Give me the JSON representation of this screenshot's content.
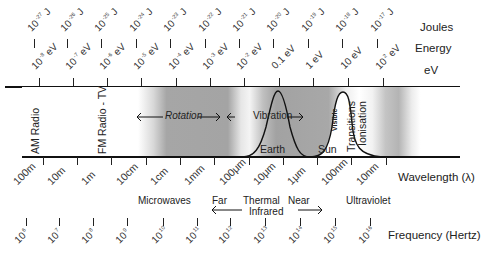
{
  "axes": {
    "joules": {
      "label": "Joules",
      "ticks": [
        {
          "base": "10",
          "exp": "-27",
          "unit": "J"
        },
        {
          "base": "10",
          "exp": "-26",
          "unit": "J"
        },
        {
          "base": "10",
          "exp": "-25",
          "unit": "J"
        },
        {
          "base": "10",
          "exp": "-24",
          "unit": "J"
        },
        {
          "base": "10",
          "exp": "-23",
          "unit": "J"
        },
        {
          "base": "10",
          "exp": "-22",
          "unit": "J"
        },
        {
          "base": "10",
          "exp": "-21",
          "unit": "J"
        },
        {
          "base": "10",
          "exp": "-20",
          "unit": "J"
        },
        {
          "base": "10",
          "exp": "-19",
          "unit": "J"
        },
        {
          "base": "10",
          "exp": "-18",
          "unit": "J"
        },
        {
          "base": "10",
          "exp": "-17",
          "unit": "J"
        }
      ]
    },
    "energy_label": "Energy",
    "ev": {
      "label": "eV",
      "ticks": [
        {
          "base": "10",
          "exp": "-8",
          "unit": "eV"
        },
        {
          "base": "10",
          "exp": "-7",
          "unit": "eV"
        },
        {
          "base": "10",
          "exp": "-6",
          "unit": "eV"
        },
        {
          "base": "10",
          "exp": "-5",
          "unit": "eV"
        },
        {
          "base": "10",
          "exp": "-4",
          "unit": "eV"
        },
        {
          "base": "10",
          "exp": "-3",
          "unit": "eV"
        },
        {
          "base": "10",
          "exp": "-2",
          "unit": "eV"
        },
        {
          "base": "0.1",
          "exp": "",
          "unit": "eV"
        },
        {
          "base": "1",
          "exp": "",
          "unit": "eV"
        },
        {
          "base": "10",
          "exp": "",
          "unit": "eV"
        },
        {
          "base": "10",
          "exp": "2",
          "unit": "eV"
        }
      ]
    },
    "wavelength": {
      "label": "Wavelength (λ)",
      "ticks": [
        "100m",
        "10m",
        "1m",
        "10cm",
        "1cm",
        "1mm",
        "100μm",
        "10μm",
        "1μm",
        "100nm",
        "10nm"
      ]
    },
    "frequency": {
      "label": "Frequency (Hertz)",
      "ticks": [
        {
          "base": "10",
          "exp": "6"
        },
        {
          "base": "10",
          "exp": "7"
        },
        {
          "base": "10",
          "exp": "8"
        },
        {
          "base": "10",
          "exp": "9"
        },
        {
          "base": "10",
          "exp": "10"
        },
        {
          "base": "10",
          "exp": "11"
        },
        {
          "base": "10",
          "exp": "12"
        },
        {
          "base": "10",
          "exp": "13"
        },
        {
          "base": "10",
          "exp": "14"
        },
        {
          "base": "10",
          "exp": "15"
        },
        {
          "base": "10",
          "exp": "16"
        }
      ]
    }
  },
  "band": {
    "am_radio": "AM Radio",
    "fm_radio": "FM Radio - TV",
    "rotation": "Rotation",
    "vibration": "Vibration",
    "visible": "Visible",
    "earth": "Earth",
    "sun": "Sun",
    "transitions": "Transitions",
    "ionisation": "Ionisation"
  },
  "regions": {
    "microwaves": "Microwaves",
    "far": "Far",
    "thermal": "Thermal",
    "infrared": "Infrared",
    "near": "Near",
    "ultraviolet": "Ultraviolet"
  },
  "colors": {
    "band_shade": "#9a9a9a",
    "line": "#111111",
    "text": "#222222"
  }
}
